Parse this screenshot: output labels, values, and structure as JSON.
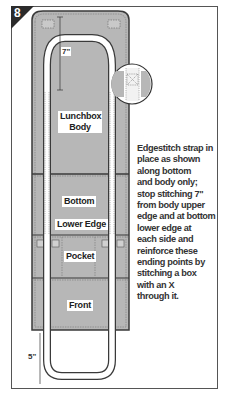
{
  "step": {
    "number": "8"
  },
  "panels": {
    "lunchbox_body": {
      "label_line1": "Lunchbox",
      "label_line2": "Body"
    },
    "bottom": {
      "label": "Bottom"
    },
    "lower_edge": {
      "label": "Lower Edge"
    },
    "pocket": {
      "label": "Pocket"
    },
    "front": {
      "label": "Front"
    }
  },
  "dimensions": {
    "top_measure": "7\"",
    "bottom_measure": "5\""
  },
  "callout": {
    "icon": "stitched-box-with-x-detail"
  },
  "caption": {
    "lines": [
      "Edgestitch strap in",
      "place as shown",
      "along bottom",
      "and body only;",
      "stop stitching 7\"",
      "from body upper",
      "edge and at bottom",
      "lower edge at",
      "each side and",
      "reinforce these",
      "ending points by",
      "stitching a box",
      "with an X",
      "through it."
    ]
  },
  "colors": {
    "fabric": "#b9b9b9",
    "fabric_dark": "#a9a9a9",
    "outline": "#444444",
    "strap": "#ffffff",
    "badge": "#2b2b2b"
  }
}
